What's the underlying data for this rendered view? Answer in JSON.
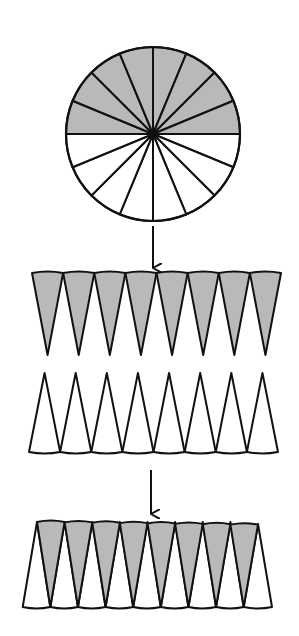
{
  "diagram": {
    "colors": {
      "fill_gray": "#b9b9b9",
      "fill_white": "#ffffff",
      "stroke": "#111111",
      "background": "#ffffff"
    },
    "circle": {
      "cx": 153,
      "cy": 134,
      "r": 87,
      "sectors": 16,
      "shaded_half": "top"
    },
    "arrows": [
      {
        "x": 153,
        "y1": 226,
        "y2": 268
      },
      {
        "x": 151,
        "y1": 470,
        "y2": 514
      }
    ],
    "gray_row": {
      "count": 8,
      "top_y": 273,
      "tip_y": 355,
      "x_start": 32,
      "x_end": 281,
      "orientation": "point-down"
    },
    "white_row": {
      "count": 8,
      "tip_y": 373,
      "base_y": 452,
      "x_start": 29,
      "x_end": 278,
      "orientation": "point-up"
    },
    "combined": {
      "count_each": 8,
      "top_y": 522,
      "bottom_y": 607,
      "gray_top_x_start": 37,
      "gray_top_x_end": 258,
      "white_base_x_start": 21,
      "white_base_x_end": 272
    }
  }
}
